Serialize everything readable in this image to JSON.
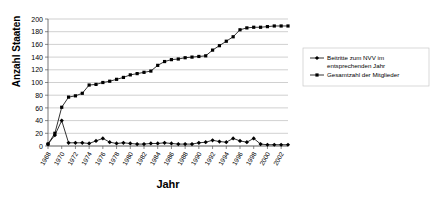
{
  "chart_data": {
    "type": "line",
    "title": "",
    "xlabel": "Jahr",
    "ylabel": "Anzahl Staaten",
    "ylim": [
      0,
      200
    ],
    "ytick_step": 20,
    "yticks": [
      0,
      20,
      40,
      60,
      80,
      100,
      120,
      140,
      160,
      180,
      200
    ],
    "grid": "horizontal",
    "legend_position": "right",
    "x": [
      1968,
      1969,
      1970,
      1971,
      1972,
      1973,
      1974,
      1975,
      1976,
      1977,
      1978,
      1979,
      1980,
      1981,
      1982,
      1983,
      1984,
      1985,
      1986,
      1987,
      1988,
      1989,
      1990,
      1991,
      1992,
      1993,
      1994,
      1995,
      1996,
      1997,
      1998,
      1999,
      2000,
      2001,
      2002,
      2003
    ],
    "xtick_labels": [
      "1968",
      "1970",
      "1972",
      "1974",
      "1976",
      "1978",
      "1980",
      "1982",
      "1984",
      "1986",
      "1988",
      "1990",
      "1992",
      "1994",
      "1996",
      "1998",
      "2000",
      "2002"
    ],
    "series": [
      {
        "name": "Beitritte zum NVV im entsprechenden Jahr",
        "marker": "diamond",
        "color": "#000000",
        "values": [
          3,
          17,
          40,
          5,
          5,
          5,
          4,
          8,
          12,
          6,
          4,
          5,
          4,
          3,
          3,
          4,
          4,
          5,
          4,
          3,
          3,
          3,
          5,
          6,
          9,
          7,
          6,
          12,
          8,
          6,
          12,
          3,
          2,
          2,
          2,
          2
        ]
      },
      {
        "name": "Gesamtzahl der Mitglieder",
        "marker": "square",
        "color": "#000000",
        "values": [
          3,
          20,
          61,
          77,
          79,
          83,
          96,
          97,
          100,
          102,
          105,
          108,
          112,
          114,
          116,
          118,
          127,
          133,
          136,
          137,
          139,
          140,
          141,
          142,
          151,
          158,
          165,
          172,
          183,
          186,
          187,
          187,
          188,
          189,
          189,
          189
        ]
      }
    ]
  },
  "legend": {
    "items": [
      {
        "label_line1": "Beitritte zum NVV im",
        "label_line2": "entsprechenden Jahr"
      },
      {
        "label_line1": "Gesamtzahl der Mitglieder",
        "label_line2": ""
      }
    ]
  }
}
